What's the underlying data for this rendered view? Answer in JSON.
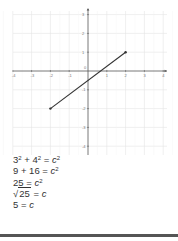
{
  "graph": {
    "x_ticks": [
      {
        "value": -4,
        "label": "-4"
      },
      {
        "value": -3,
        "label": "-3"
      },
      {
        "value": -2,
        "label": "-2"
      },
      {
        "value": -1,
        "label": "-1"
      },
      {
        "value": 1,
        "label": "1"
      },
      {
        "value": 2,
        "label": "2"
      },
      {
        "value": 3,
        "label": "3"
      },
      {
        "value": 4,
        "label": "4"
      }
    ],
    "y_ticks": [
      {
        "value": 3,
        "label": "3"
      },
      {
        "value": 2,
        "label": "2"
      },
      {
        "value": 1,
        "label": "1"
      },
      {
        "value": -1,
        "label": "-1"
      },
      {
        "value": -2,
        "label": "-2"
      },
      {
        "value": -3,
        "label": "-3"
      },
      {
        "value": -4,
        "label": "-4"
      }
    ],
    "origin_label": "0",
    "segment": {
      "start": {
        "x": -2,
        "y": -2
      },
      "end": {
        "x": 2,
        "y": 1
      }
    },
    "colors": {
      "grid": "#e4e4e4",
      "axis": "#555555",
      "segment": "#333333"
    }
  },
  "equations": {
    "line1": {
      "a": "3",
      "a_exp": "2",
      "plus": "+",
      "b": "4",
      "b_exp": "2",
      "eq": "=",
      "c": "c",
      "c_exp": "2"
    },
    "line2": {
      "left": "9 + 16",
      "eq": "=",
      "c": "c",
      "c_exp": "2"
    },
    "line3": {
      "left": "25",
      "eq": "=",
      "c": "c",
      "c_exp": "2"
    },
    "line4": {
      "radicand": "25",
      "eq": "=",
      "c": "c"
    },
    "line5": {
      "left": "5",
      "eq": "=",
      "c": "c"
    }
  }
}
